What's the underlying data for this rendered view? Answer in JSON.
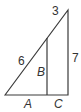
{
  "diagram": {
    "type": "right-triangle-with-inner-segment",
    "labels": {
      "top_segment": "3",
      "hypotenuse_lower": "6",
      "right_side": "7",
      "inner_vertical": "B",
      "base_left": "A",
      "base_right": "C"
    },
    "colors": {
      "line": "#3a3a3a",
      "text": "#333333",
      "background": "#ffffff"
    }
  }
}
